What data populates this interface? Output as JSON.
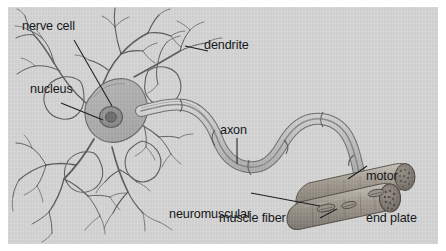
{
  "figure": {
    "width": 446,
    "height": 251,
    "background_color": "#ffffff",
    "panel_color": "#d6d6d6",
    "ink_color": "#15171a",
    "line_color": "#4a4a4a"
  },
  "labels": {
    "nerve_cell": "nerve cell",
    "dendrite": "dendrite",
    "nucleus": "nucleus",
    "axon": "axon",
    "neuromuscular_line1": "neuromuscular",
    "neuromuscular_line2": "junction",
    "motor_line1": "motor",
    "motor_line2": "end plate",
    "muscle_fiber": "muscle fiber"
  },
  "structures": [
    {
      "name": "soma",
      "label": "nerve cell",
      "description": "polygonal cell body of the neuron"
    },
    {
      "name": "nucleus",
      "label": "nucleus",
      "description": "round dark nucleus with nucleolus inside the soma"
    },
    {
      "name": "dendrites",
      "label": "dendrite",
      "description": "branching fibers radiating from the soma"
    },
    {
      "name": "axon",
      "label": "axon",
      "description": "long myelinated S-shaped fiber leaving the soma"
    },
    {
      "name": "neuromuscular-junction",
      "label": "neuromuscular junction",
      "description": "contact site of axon terminal and muscle"
    },
    {
      "name": "motor-end-plate",
      "label": "motor end plate",
      "description": "flattened terminal endings on the muscle surface"
    },
    {
      "name": "muscle-fiber",
      "label": "muscle fiber",
      "description": "bundle of striated cylindrical fibers"
    }
  ]
}
